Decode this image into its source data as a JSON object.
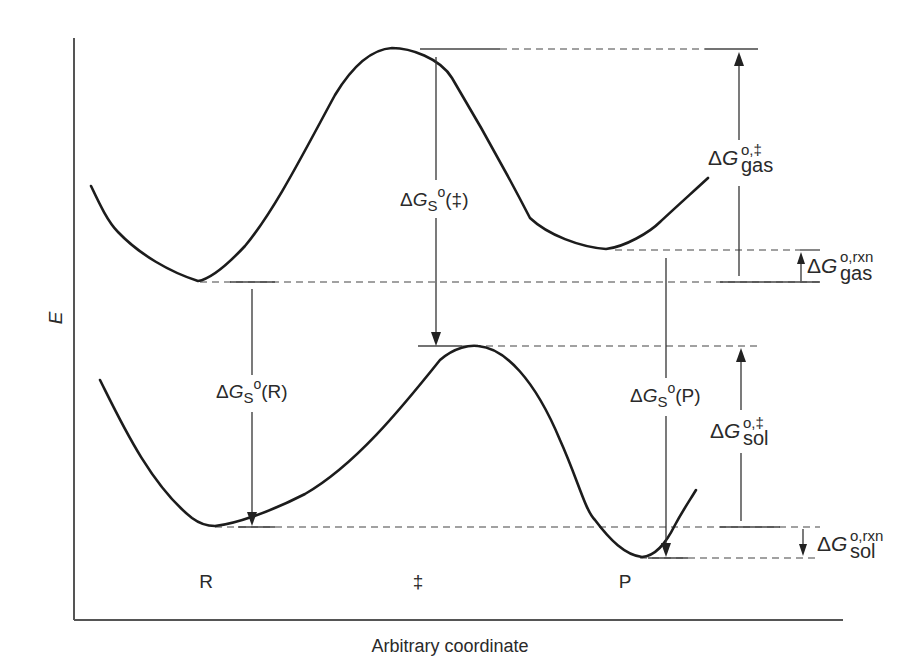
{
  "diagram": {
    "type": "reaction energy profile (gas vs solution)",
    "y_axis_label": "E",
    "x_axis_label": "Arbitrary coordinate",
    "x_markers": [
      {
        "id": "R",
        "label": "R",
        "x": 206
      },
      {
        "id": "TS",
        "label": "‡",
        "x": 418
      },
      {
        "id": "P",
        "label": "P",
        "x": 625
      }
    ],
    "curves": [
      {
        "name": "gas-phase-profile",
        "level": "upper",
        "reactant_min_y": 281,
        "ts_max_y": 48,
        "product_min_y": 249
      },
      {
        "name": "solution-phase-profile",
        "level": "lower",
        "reactant_min_y": 526,
        "ts_max_y": 346,
        "product_min_y": 557
      }
    ],
    "labels": {
      "dGs_TS": {
        "delta": "Δ",
        "G": "G",
        "sub": "S",
        "sup": "o",
        "arg": "(‡)"
      },
      "dGs_R": {
        "delta": "Δ",
        "G": "G",
        "sub": "S",
        "sup": "o",
        "arg": "(R)"
      },
      "dGs_P": {
        "delta": "Δ",
        "G": "G",
        "sub": "S",
        "sup": "o",
        "arg": "(P)"
      },
      "dG_gas_act": {
        "delta": "Δ",
        "G": "G",
        "sub": "gas",
        "sup": "o,‡"
      },
      "dG_gas_rxn": {
        "delta": "Δ",
        "G": "G",
        "sub": "gas",
        "sup": "o,rxn"
      },
      "dG_sol_act": {
        "delta": "Δ",
        "G": "G",
        "sub": "sol",
        "sup": "o,‡"
      },
      "dG_sol_rxn": {
        "delta": "Δ",
        "G": "G",
        "sub": "sol",
        "sup": "o,rxn"
      }
    },
    "colors": {
      "curve": "#1c1c1c",
      "axis": "#555555",
      "text": "#2a2a2a",
      "background": "#ffffff"
    }
  }
}
